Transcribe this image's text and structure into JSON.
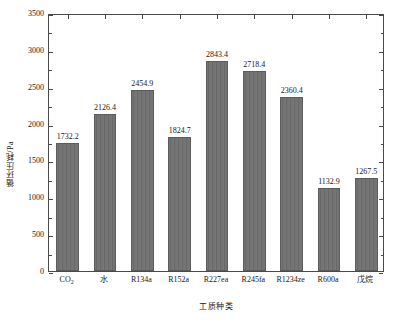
{
  "chart_data": {
    "type": "bar",
    "title": "",
    "xlabel": "工质种类",
    "ylabel": "循环压耗/Pa",
    "categories": [
      "CO2",
      "水",
      "R134a",
      "R152a",
      "R227ea",
      "R245fa",
      "R1234ze",
      "R600a",
      "戊烷"
    ],
    "category_labels_html": [
      "CO<sub>2</sub>",
      "水",
      "R134a",
      "R152a",
      "R227ea",
      "R245fa",
      "R1234ze",
      "R600a",
      "戊烷"
    ],
    "values": [
      1732.2,
      2126.4,
      2454.9,
      1824.7,
      2843.4,
      2718.4,
      2360.4,
      1132.9,
      1267.5
    ],
    "value_labels": [
      "1732.2",
      "2126.4",
      "2454.9",
      "1824.7",
      "2843.4",
      "2718.4",
      "2360.4",
      "1132.9",
      "1267.5"
    ],
    "ylim": [
      0,
      3500
    ],
    "ytick_values": [
      0,
      500,
      1000,
      1500,
      2000,
      2500,
      3000,
      3500
    ],
    "ytick_labels": [
      "0",
      "500",
      "1000",
      "1500",
      "2000",
      "2500",
      "3000",
      "3500"
    ],
    "yminor_tick_values": [
      250,
      750,
      1250,
      1750,
      2250,
      2750,
      3250
    ],
    "grid": false,
    "legend": null,
    "bar_color": "#6f6f6f",
    "bar_edge_color": "#5c5c5c",
    "axis_color": "#4a4a4a",
    "text_color": "#1a1a1a",
    "background_color": "#ffffff"
  }
}
